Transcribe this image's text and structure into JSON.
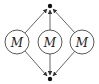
{
  "diagram": {
    "nodes": [
      {
        "id": "top",
        "kind": "dot",
        "label": ""
      },
      {
        "id": "m1",
        "kind": "circle",
        "label": "M"
      },
      {
        "id": "m2",
        "kind": "circle",
        "label": "M"
      },
      {
        "id": "m3",
        "kind": "circle",
        "label": "M"
      },
      {
        "id": "bottom",
        "kind": "dot",
        "label": ""
      }
    ],
    "edges": [
      {
        "from": "m1",
        "to": "top",
        "directed": true
      },
      {
        "from": "m2",
        "to": "top",
        "directed": true
      },
      {
        "from": "m3",
        "to": "top",
        "directed": true
      },
      {
        "from": "m1",
        "to": "bottom",
        "directed": true
      },
      {
        "from": "m2",
        "to": "bottom",
        "directed": true
      },
      {
        "from": "m3",
        "to": "bottom",
        "directed": true
      }
    ],
    "colors": {
      "stroke": "#444444",
      "dot": "#111111",
      "background": "#ffffff"
    }
  }
}
